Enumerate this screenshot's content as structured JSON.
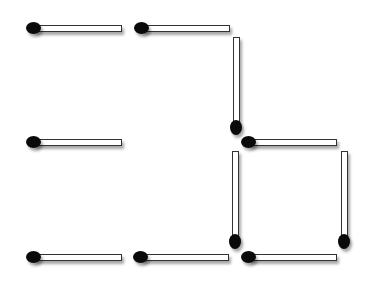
{
  "puzzle": {
    "type": "matchstick-arrangement",
    "match_count": 11,
    "colors": {
      "stick": "#ffffff",
      "outline": "#333333",
      "head": "#0a0a0a",
      "background": "#ffffff"
    },
    "matches": [
      {
        "id": "m1",
        "orientation": "horizontal",
        "x": 26,
        "y": 22,
        "head": "left"
      },
      {
        "id": "m2",
        "orientation": "horizontal",
        "x": 134,
        "y": 22,
        "head": "left"
      },
      {
        "id": "m3",
        "orientation": "vertical",
        "x": 230,
        "y": 37,
        "head": "bottom"
      },
      {
        "id": "m4",
        "orientation": "horizontal",
        "x": 26,
        "y": 136,
        "head": "left"
      },
      {
        "id": "m5",
        "orientation": "horizontal",
        "x": 241,
        "y": 136,
        "head": "left"
      },
      {
        "id": "m6",
        "orientation": "vertical",
        "x": 229,
        "y": 151,
        "head": "bottom"
      },
      {
        "id": "m7",
        "orientation": "vertical",
        "x": 338,
        "y": 151,
        "head": "bottom"
      },
      {
        "id": "m8",
        "orientation": "horizontal",
        "x": 26,
        "y": 251,
        "head": "left"
      },
      {
        "id": "m9",
        "orientation": "horizontal",
        "x": 133,
        "y": 251,
        "head": "left"
      },
      {
        "id": "m10",
        "orientation": "horizontal",
        "x": 241,
        "y": 251,
        "head": "left"
      }
    ]
  }
}
